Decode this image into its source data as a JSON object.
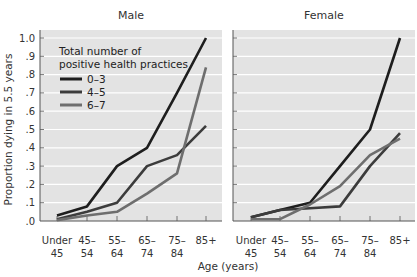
{
  "chart_data": {
    "type": "line",
    "ylabel": "Proportion dying in 5.5 years",
    "xlabel": "Age (years)",
    "ylim": [
      0,
      1.0
    ],
    "yticks": [
      ".0",
      ".1",
      ".2",
      ".3",
      ".4",
      ".5",
      ".6",
      ".7",
      ".8",
      ".9",
      "1.0"
    ],
    "grid": true,
    "categories": [
      "Under 45",
      "45–54",
      "55–64",
      "65–74",
      "75–84",
      "85+"
    ],
    "category_lines": [
      [
        "Under",
        "45"
      ],
      [
        "45–",
        "54"
      ],
      [
        "55–",
        "64"
      ],
      [
        "65–",
        "74"
      ],
      [
        "75–",
        "84"
      ],
      [
        "85+",
        ""
      ]
    ],
    "legend": {
      "title_line1": "Total number of",
      "title_line2": "positive health practices",
      "position": "upper-left of Male panel"
    },
    "panels": [
      {
        "title": "Male",
        "series": [
          {
            "name": "0–3",
            "color": "#1e1e1e",
            "values": [
              0.03,
              0.08,
              0.3,
              0.4,
              0.7,
              1.0
            ]
          },
          {
            "name": "4–5",
            "color": "#3c3c3c",
            "values": [
              0.01,
              0.05,
              0.1,
              0.3,
              0.36,
              0.52
            ]
          },
          {
            "name": "6–7",
            "color": "#6e6e6e",
            "values": [
              0.005,
              0.03,
              0.05,
              0.15,
              0.26,
              0.84
            ]
          }
        ]
      },
      {
        "title": "Female",
        "series": [
          {
            "name": "0–3",
            "color": "#1e1e1e",
            "values": [
              0.02,
              0.06,
              0.1,
              0.3,
              0.5,
              1.0
            ]
          },
          {
            "name": "4–5",
            "color": "#3c3c3c",
            "values": [
              0.02,
              0.06,
              0.07,
              0.08,
              0.3,
              0.48
            ]
          },
          {
            "name": "6–7",
            "color": "#6e6e6e",
            "values": [
              0.01,
              0.01,
              0.09,
              0.19,
              0.36,
              0.45
            ]
          }
        ]
      }
    ]
  },
  "colors": {
    "plot_bg": "#e3e3e3",
    "gridline": "#ffffff",
    "axis": "#555555"
  }
}
